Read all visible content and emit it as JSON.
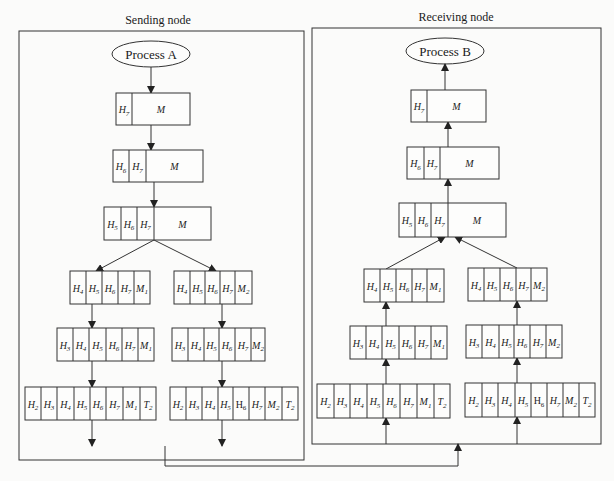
{
  "panels": [
    {
      "id": "sending",
      "title": "Sending node",
      "process": "Process A",
      "frame": {
        "x": 19,
        "y": 31,
        "w": 285,
        "h": 429
      },
      "title_pos": {
        "x": 158,
        "y": 24
      },
      "ellipse": {
        "cx": 151,
        "cy": 54,
        "rx": 39,
        "ry": 13
      },
      "direction": "down",
      "boxes": [
        {
          "id": "L1",
          "x": 116,
          "y": 93,
          "h": 32,
          "cells": [
            {
              "t": "H",
              "s": "7",
              "w": 16
            },
            {
              "t": "M",
              "s": "",
              "w": 58
            }
          ]
        },
        {
          "id": "L2",
          "x": 113,
          "y": 150,
          "h": 32,
          "cells": [
            {
              "t": "H",
              "s": "6",
              "w": 16
            },
            {
              "t": "H",
              "s": "7",
              "w": 17
            },
            {
              "t": "M",
              "s": "",
              "w": 57
            }
          ]
        },
        {
          "id": "L3",
          "x": 104,
          "y": 207,
          "h": 33,
          "cells": [
            {
              "t": "H",
              "s": "5",
              "w": 17
            },
            {
              "t": "H",
              "s": "6",
              "w": 16
            },
            {
              "t": "H",
              "s": "7",
              "w": 17
            },
            {
              "t": "M",
              "s": "",
              "w": 57
            }
          ]
        },
        {
          "id": "L4a",
          "x": 70,
          "y": 271,
          "h": 33,
          "cells": [
            {
              "t": "H",
              "s": "4",
              "w": 16
            },
            {
              "t": "H",
              "s": "5",
              "w": 16
            },
            {
              "t": "H",
              "s": "6",
              "w": 16
            },
            {
              "t": "H",
              "s": "7",
              "w": 16
            },
            {
              "t": "M",
              "s": "1",
              "w": 16
            }
          ]
        },
        {
          "id": "L4b",
          "x": 174,
          "y": 271,
          "h": 33,
          "cells": [
            {
              "t": "H",
              "s": "4",
              "w": 16
            },
            {
              "t": "H",
              "s": "5",
              "w": 15
            },
            {
              "t": "H",
              "s": "6",
              "w": 15
            },
            {
              "t": "H",
              "s": "7",
              "w": 15
            },
            {
              "t": "M",
              "s": "2",
              "w": 17
            }
          ]
        },
        {
          "id": "L5a",
          "x": 57,
          "y": 328,
          "h": 33,
          "cells": [
            {
              "t": "H",
              "s": "3",
              "w": 16
            },
            {
              "t": "H",
              "s": "4",
              "w": 16
            },
            {
              "t": "H",
              "s": "5",
              "w": 17
            },
            {
              "t": "H",
              "s": "6",
              "w": 16
            },
            {
              "t": "H",
              "s": "7",
              "w": 16
            },
            {
              "t": "M",
              "s": "1",
              "w": 16
            }
          ]
        },
        {
          "id": "L5b",
          "x": 172,
          "y": 328,
          "h": 33,
          "cells": [
            {
              "t": "H",
              "s": "3",
              "w": 16
            },
            {
              "t": "H",
              "s": "4",
              "w": 16
            },
            {
              "t": "H",
              "s": "5",
              "w": 15
            },
            {
              "t": "H",
              "s": "6",
              "w": 16
            },
            {
              "t": "H",
              "s": "7",
              "w": 16
            },
            {
              "t": "M",
              "s": "2",
              "w": 14
            }
          ]
        },
        {
          "id": "L6a",
          "x": 25,
          "y": 387,
          "h": 33,
          "cells": [
            {
              "t": "H",
              "s": "2",
              "w": 16
            },
            {
              "t": "H",
              "s": "3",
              "w": 16
            },
            {
              "t": "H",
              "s": "4",
              "w": 17
            },
            {
              "t": "H",
              "s": "5",
              "w": 16
            },
            {
              "t": "H",
              "s": "6",
              "w": 16
            },
            {
              "t": "H",
              "s": "7",
              "w": 17
            },
            {
              "t": "M",
              "s": "1",
              "w": 17
            },
            {
              "t": "T",
              "s": "2",
              "w": 16
            }
          ]
        },
        {
          "id": "L6b",
          "x": 170,
          "y": 387,
          "h": 33,
          "cells": [
            {
              "t": "H",
              "s": "2",
              "w": 16
            },
            {
              "t": "H",
              "s": "3",
              "w": 16
            },
            {
              "t": "H",
              "s": "4",
              "w": 16
            },
            {
              "t": "H",
              "s": "5",
              "w": 15
            },
            {
              "t": "H",
              "s": "6",
              "w": 16,
              "upright": true
            },
            {
              "t": "H",
              "s": "7",
              "w": 16
            },
            {
              "t": "M",
              "s": "2",
              "w": 17
            },
            {
              "t": "T",
              "s": "2",
              "w": 16
            }
          ]
        }
      ],
      "arrows": [
        {
          "x1": 151,
          "y1": 67,
          "x2": 151,
          "y2": 93,
          "head": "end"
        },
        {
          "x1": 151,
          "y1": 125,
          "x2": 151,
          "y2": 150,
          "head": "end"
        },
        {
          "x1": 154,
          "y1": 182,
          "x2": 154,
          "y2": 207,
          "head": "end"
        },
        {
          "x1": 154,
          "y1": 240,
          "x2": 96,
          "y2": 271,
          "head": "end"
        },
        {
          "x1": 154,
          "y1": 240,
          "x2": 216,
          "y2": 271,
          "head": "end"
        },
        {
          "x1": 92,
          "y1": 304,
          "x2": 92,
          "y2": 328,
          "head": "end"
        },
        {
          "x1": 222,
          "y1": 304,
          "x2": 222,
          "y2": 328,
          "head": "end"
        },
        {
          "x1": 92,
          "y1": 361,
          "x2": 92,
          "y2": 387,
          "head": "end"
        },
        {
          "x1": 222,
          "y1": 361,
          "x2": 222,
          "y2": 387,
          "head": "end"
        },
        {
          "x1": 92,
          "y1": 420,
          "x2": 92,
          "y2": 446,
          "head": "end"
        },
        {
          "x1": 222,
          "y1": 420,
          "x2": 222,
          "y2": 446,
          "head": "end"
        }
      ]
    },
    {
      "id": "receiving",
      "title": "Receiving node",
      "process": "Process B",
      "frame": {
        "x": 312,
        "y": 28,
        "w": 289,
        "h": 416
      },
      "title_pos": {
        "x": 456,
        "y": 21
      },
      "ellipse": {
        "cx": 445,
        "cy": 51,
        "rx": 39,
        "ry": 13
      },
      "direction": "up",
      "boxes": [
        {
          "id": "R1",
          "x": 411,
          "y": 90,
          "h": 32,
          "cells": [
            {
              "t": "H",
              "s": "7",
              "w": 16
            },
            {
              "t": "M",
              "s": "",
              "w": 59
            }
          ]
        },
        {
          "id": "R2",
          "x": 407,
          "y": 147,
          "h": 32,
          "cells": [
            {
              "t": "H",
              "s": "6",
              "w": 17
            },
            {
              "t": "H",
              "s": "7",
              "w": 16
            },
            {
              "t": "M",
              "s": "",
              "w": 59
            }
          ]
        },
        {
          "id": "R3",
          "x": 399,
          "y": 203,
          "h": 34,
          "cells": [
            {
              "t": "H",
              "s": "5",
              "w": 16
            },
            {
              "t": "H",
              "s": "6",
              "w": 16
            },
            {
              "t": "H",
              "s": "7",
              "w": 17
            },
            {
              "t": "M",
              "s": "",
              "w": 58
            }
          ]
        },
        {
          "id": "R4a",
          "x": 364,
          "y": 269,
          "h": 33,
          "cells": [
            {
              "t": "H",
              "s": "4",
              "w": 16
            },
            {
              "t": "H",
              "s": "5",
              "w": 16
            },
            {
              "t": "H",
              "s": "6",
              "w": 16
            },
            {
              "t": "H",
              "s": "7",
              "w": 15
            },
            {
              "t": "M",
              "s": "1",
              "w": 17
            }
          ]
        },
        {
          "id": "R4b",
          "x": 468,
          "y": 268,
          "h": 33,
          "cells": [
            {
              "t": "H",
              "s": "4",
              "w": 16
            },
            {
              "t": "H",
              "s": "5",
              "w": 16
            },
            {
              "t": "H",
              "s": "6",
              "w": 16
            },
            {
              "t": "H",
              "s": "7",
              "w": 15
            },
            {
              "t": "M",
              "s": "2",
              "w": 16
            }
          ]
        },
        {
          "id": "R5a",
          "x": 350,
          "y": 326,
          "h": 33,
          "cells": [
            {
              "t": "H",
              "s": "3",
              "w": 16
            },
            {
              "t": "H",
              "s": "4",
              "w": 16
            },
            {
              "t": "H",
              "s": "5",
              "w": 17
            },
            {
              "t": "H",
              "s": "6",
              "w": 16
            },
            {
              "t": "H",
              "s": "7",
              "w": 16
            },
            {
              "t": "M",
              "s": "1",
              "w": 16
            }
          ]
        },
        {
          "id": "R5b",
          "x": 466,
          "y": 325,
          "h": 33,
          "cells": [
            {
              "t": "H",
              "s": "3",
              "w": 16
            },
            {
              "t": "H",
              "s": "4",
              "w": 17
            },
            {
              "t": "H",
              "s": "5",
              "w": 15
            },
            {
              "t": "H",
              "s": "6",
              "w": 16
            },
            {
              "t": "H",
              "s": "7",
              "w": 16
            },
            {
              "t": "M",
              "s": "2",
              "w": 16
            }
          ]
        },
        {
          "id": "R5c",
          "x": 317,
          "y": 384,
          "h": 34,
          "cells": [
            {
              "t": "H",
              "s": "2",
              "w": 17
            },
            {
              "t": "H",
              "s": "3",
              "w": 16
            },
            {
              "t": "H",
              "s": "4",
              "w": 17
            },
            {
              "t": "H",
              "s": "5",
              "w": 16
            },
            {
              "t": "H",
              "s": "6",
              "w": 17
            },
            {
              "t": "H",
              "s": "7",
              "w": 17
            },
            {
              "t": "M",
              "s": "1",
              "w": 17
            },
            {
              "t": "T",
              "s": "2",
              "w": 16
            }
          ]
        },
        {
          "id": "R5d",
          "x": 465,
          "y": 383,
          "h": 34,
          "cells": [
            {
              "t": "H",
              "s": "2",
              "w": 17
            },
            {
              "t": "H",
              "s": "3",
              "w": 16
            },
            {
              "t": "H",
              "s": "4",
              "w": 17
            },
            {
              "t": "H",
              "s": "5",
              "w": 16
            },
            {
              "t": "H",
              "s": "6",
              "w": 16,
              "upright": true
            },
            {
              "t": "H",
              "s": "7",
              "w": 16
            },
            {
              "t": "M",
              "s": "2",
              "w": 16
            },
            {
              "t": "T",
              "s": "2",
              "w": 16
            }
          ]
        }
      ],
      "arrows": [
        {
          "x1": 445,
          "y1": 90,
          "x2": 445,
          "y2": 64,
          "head": "end"
        },
        {
          "x1": 448,
          "y1": 147,
          "x2": 448,
          "y2": 122,
          "head": "end"
        },
        {
          "x1": 448,
          "y1": 203,
          "x2": 448,
          "y2": 179,
          "head": "end"
        },
        {
          "x1": 386,
          "y1": 269,
          "x2": 445,
          "y2": 237,
          "head": "end"
        },
        {
          "x1": 517,
          "y1": 268,
          "x2": 455,
          "y2": 237,
          "head": "end"
        },
        {
          "x1": 386,
          "y1": 326,
          "x2": 386,
          "y2": 302,
          "head": "end"
        },
        {
          "x1": 517,
          "y1": 325,
          "x2": 517,
          "y2": 301,
          "head": "end"
        },
        {
          "x1": 386,
          "y1": 384,
          "x2": 386,
          "y2": 359,
          "head": "end"
        },
        {
          "x1": 517,
          "y1": 383,
          "x2": 517,
          "y2": 358,
          "head": "end"
        },
        {
          "x1": 386,
          "y1": 444,
          "x2": 386,
          "y2": 418,
          "head": "end"
        },
        {
          "x1": 517,
          "y1": 444,
          "x2": 517,
          "y2": 417,
          "head": "end"
        }
      ]
    }
  ],
  "link": {
    "points": [
      [
        165,
        446
      ],
      [
        165,
        466
      ],
      [
        458,
        466
      ],
      [
        458,
        444
      ]
    ],
    "description": "Physical link from sending node to receiving node"
  },
  "colors": {
    "line": "#333333",
    "text": "#1a1a1a",
    "background": "#fbfbfa"
  }
}
